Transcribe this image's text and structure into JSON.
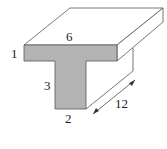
{
  "diagram": {
    "type": "T-shaped prism",
    "colors": {
      "front_face": "#b4b4b4",
      "outline": "#555555",
      "background": "#ffffff"
    },
    "labels": {
      "top_width": "6",
      "flange_thickness": "1",
      "stem_height": "3",
      "stem_width": "2",
      "length": "12"
    }
  }
}
